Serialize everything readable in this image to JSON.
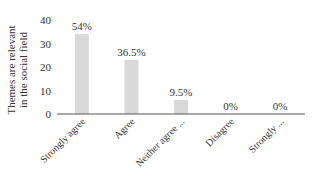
{
  "chart_data": {
    "type": "bar",
    "title": "",
    "xlabel": "",
    "ylabel": "Themes are relevant in the social field",
    "ylabel_lines": [
      "Themes are relevant",
      "in the social field"
    ],
    "categories": [
      "Strongly agree",
      "Agree",
      "Neither agree ...",
      "Disagree",
      "Strongly ..."
    ],
    "values": [
      34,
      23,
      6,
      0,
      0
    ],
    "data_labels": [
      "54%",
      "36.5%",
      "9.5%",
      "0%",
      "0%"
    ],
    "ylim": [
      0,
      40
    ],
    "yticks": [
      0,
      10,
      20,
      30,
      40
    ],
    "grid": false,
    "legend": null,
    "bar_color": "#d9d9d9",
    "axis_color": "#555555"
  }
}
